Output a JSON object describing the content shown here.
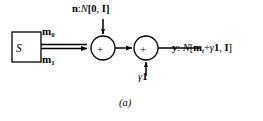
{
  "figure": {
    "caption": "(a)",
    "colors": {
      "stroke": "#000000",
      "background": "#ffffff",
      "text": "#000000"
    },
    "source_block": {
      "label": "S",
      "name": "source"
    },
    "branch_labels": {
      "top": {
        "symbol": "m",
        "subscript": "0"
      },
      "bottom": {
        "symbol": "m",
        "subscript": "1"
      }
    },
    "noise_input": {
      "variable": "n",
      "separator": ":",
      "distribution": "N",
      "open_bracket": "[",
      "mean": "0",
      "comma": ",",
      "covariance": "I",
      "close_bracket": "]"
    },
    "bias_input": {
      "gamma": "γ",
      "vector": "1"
    },
    "adders": [
      {
        "name": "adder-noise",
        "operator": "+"
      },
      {
        "name": "adder-bias",
        "operator": "+"
      }
    ],
    "output": {
      "variable": "y",
      "separator": ":",
      "distribution": "N",
      "open_bracket": "[",
      "mean_symbol": "m",
      "mean_subscript": "i",
      "plus": "+",
      "gamma": "γ",
      "ones_vector": "1",
      "comma": ",",
      "covariance": "I",
      "close_bracket": "]"
    }
  }
}
